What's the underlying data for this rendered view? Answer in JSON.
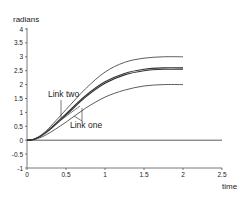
{
  "chart_data": {
    "type": "line",
    "title": "",
    "xlabel": "time",
    "ylabel": "radians",
    "xlim": [
      0,
      2.5
    ],
    "ylim": [
      -1,
      4
    ],
    "xticks": [
      "0",
      "0.5",
      "1",
      "1.5",
      "2",
      "2.5"
    ],
    "yticks": [
      "-1",
      "-0.5",
      "0",
      "0.5",
      "1",
      "1.5",
      "2",
      "2.5",
      "3",
      "3.5",
      "4"
    ],
    "grid": false,
    "legend": null,
    "annotations": [
      {
        "text": "Link two",
        "x": 0.5,
        "y": 1.9
      },
      {
        "text": "Link one",
        "x": 0.65,
        "y": 0.55
      }
    ],
    "series": [
      {
        "name": "Link two upper bound",
        "x": [
          0,
          0.1,
          0.25,
          0.5,
          0.75,
          1.0,
          1.25,
          1.5,
          1.75,
          2.0
        ],
        "values": [
          0,
          0.05,
          0.35,
          1.1,
          1.85,
          2.45,
          2.8,
          2.95,
          3.0,
          3.0
        ]
      },
      {
        "name": "Link two",
        "x": [
          0,
          0.1,
          0.25,
          0.5,
          0.75,
          1.0,
          1.25,
          1.5,
          1.75,
          2.0
        ],
        "values": [
          0,
          0.04,
          0.3,
          0.95,
          1.6,
          2.1,
          2.4,
          2.55,
          2.6,
          2.6
        ]
      },
      {
        "name": "Link one",
        "x": [
          0,
          0.1,
          0.25,
          0.5,
          0.75,
          1.0,
          1.25,
          1.5,
          1.75,
          2.0
        ],
        "values": [
          0,
          0.04,
          0.28,
          0.9,
          1.55,
          2.05,
          2.35,
          2.5,
          2.55,
          2.55
        ]
      },
      {
        "name": "Link one lower bound",
        "x": [
          0,
          0.1,
          0.25,
          0.5,
          0.75,
          1.0,
          1.25,
          1.5,
          1.75,
          2.0
        ],
        "values": [
          0,
          0.03,
          0.2,
          0.65,
          1.15,
          1.55,
          1.8,
          1.95,
          2.0,
          2.0
        ]
      },
      {
        "name": "zero line",
        "x": [
          0,
          2.5
        ],
        "values": [
          0,
          0
        ]
      }
    ]
  }
}
